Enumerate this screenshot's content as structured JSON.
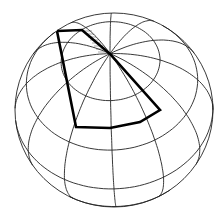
{
  "diagram": {
    "type": "globe-graticule",
    "center": [
      114,
      110
    ],
    "radius": [
      99,
      97
    ],
    "pole": [
      110,
      54
    ],
    "pole_vector": [
      -0.04,
      -0.58,
      0.81
    ],
    "meridian_step_deg": 30,
    "parallels_deg": [
      60,
      30,
      0,
      -30,
      -60
    ],
    "line_color": "#222222",
    "highlight_color": "#000000",
    "highlight_outline": [
      [
        57,
        31
      ],
      [
        82,
        30
      ],
      [
        110,
        54
      ],
      [
        160,
        110
      ],
      [
        140,
        122
      ],
      [
        110,
        128
      ],
      [
        76,
        127
      ],
      [
        57,
        31
      ]
    ],
    "hatched_region": [
      [
        82,
        30
      ],
      [
        90,
        30
      ],
      [
        110,
        54
      ],
      [
        96,
        42
      ]
    ]
  }
}
